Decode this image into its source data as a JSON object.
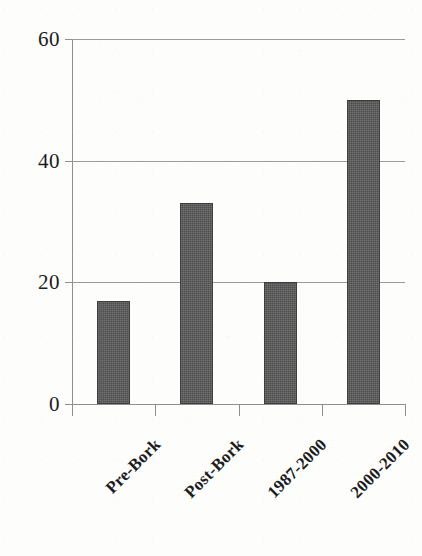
{
  "chart_data": {
    "type": "bar",
    "title": "",
    "subtitle": "",
    "xlabel": "",
    "ylabel": "",
    "categories": [
      "Pre-Bork",
      "Post-Bork",
      "1987-2000",
      "2000-2010"
    ],
    "values": [
      17,
      33,
      20,
      50
    ],
    "ylim": [
      0,
      60
    ],
    "yticks": [
      0,
      20,
      40,
      60
    ],
    "ytick_labels": [
      "0",
      "20",
      "40",
      "60"
    ],
    "grid": true,
    "grid_axis": "y",
    "legend": false,
    "legend_position": "none",
    "bar_color": "#4d4d4d",
    "grid_color": "#9a9a9a",
    "axis_color": "#8e8e8e",
    "background_color": "#fdfdfc",
    "text_color": "#1c1c1c",
    "xtick_rotation": -45,
    "series": [
      {
        "name": "",
        "values": [
          17,
          33,
          20,
          50
        ]
      }
    ],
    "points": [
      {
        "category": "Pre-Bork",
        "value": 17
      },
      {
        "category": "Post-Bork",
        "value": 33
      },
      {
        "category": "1987-2000",
        "value": 20
      },
      {
        "category": "2000-2010",
        "value": 50
      }
    ]
  }
}
